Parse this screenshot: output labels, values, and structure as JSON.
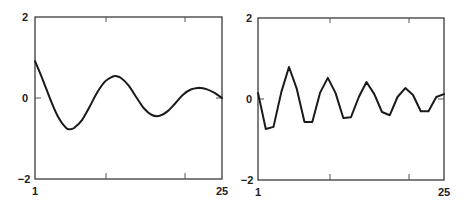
{
  "chart_data": [
    {
      "type": "line",
      "title": "",
      "xlabel": "",
      "ylabel": "",
      "x_tick_labels": [
        "1",
        "25"
      ],
      "y_tick_labels": [
        "2",
        "0",
        "-2"
      ],
      "xlim": [
        1,
        25
      ],
      "ylim": [
        -2,
        2
      ],
      "grid": false,
      "legend": null,
      "style": "smooth damped oscillation",
      "x": [
        1,
        2,
        3,
        4,
        5,
        5.5,
        6,
        7,
        8,
        9,
        10,
        11,
        11.4,
        12,
        13,
        14,
        15,
        16,
        17,
        18,
        19,
        20,
        21,
        22,
        22.2,
        23,
        24,
        25
      ],
      "series": [
        {
          "name": "smooth",
          "values": [
            0.91,
            0.45,
            -0.05,
            -0.48,
            -0.74,
            -0.77,
            -0.74,
            -0.55,
            -0.22,
            0.14,
            0.41,
            0.53,
            0.54,
            0.5,
            0.31,
            0.02,
            -0.26,
            -0.42,
            -0.44,
            -0.33,
            -0.13,
            0.08,
            0.21,
            0.25,
            0.25,
            0.22,
            0.13,
            0.0
          ]
        }
      ]
    },
    {
      "type": "line",
      "title": "",
      "xlabel": "",
      "ylabel": "",
      "x_tick_labels": [
        "1",
        "25"
      ],
      "y_tick_labels": [
        "2",
        "0",
        "-2"
      ],
      "xlim": [
        1,
        25
      ],
      "ylim": [
        -2,
        2
      ],
      "grid": false,
      "legend": null,
      "style": "piecewise-linear damped oscillation",
      "x": [
        1,
        2,
        3,
        4,
        5,
        6,
        7,
        8,
        9,
        10,
        11,
        12,
        13,
        14,
        15,
        16,
        17,
        18,
        19,
        20,
        21,
        22,
        23,
        24,
        25
      ],
      "series": [
        {
          "name": "sampled",
          "values": [
            0.15,
            -0.74,
            -0.69,
            0.17,
            0.79,
            0.25,
            -0.57,
            -0.57,
            0.15,
            0.52,
            0.15,
            -0.47,
            -0.45,
            0.05,
            0.42,
            0.12,
            -0.32,
            -0.4,
            0.05,
            0.27,
            0.1,
            -0.3,
            -0.3,
            0.05,
            0.12
          ]
        }
      ]
    }
  ],
  "panels": [
    {
      "y_top": "2",
      "y_mid": "0",
      "y_bottom": "−2",
      "x_left": "1",
      "x_right": "25"
    },
    {
      "y_top": "2",
      "y_mid": "0",
      "y_bottom": "−2",
      "x_left": "1",
      "x_right": "25"
    }
  ]
}
